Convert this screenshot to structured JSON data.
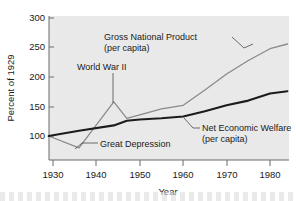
{
  "chart_data": {
    "type": "line",
    "title": "",
    "xlabel": "Year",
    "ylabel": "Percent of 1929",
    "xlim": [
      1929,
      1984
    ],
    "ylim": [
      60,
      300
    ],
    "xticks": [
      "1930",
      "1940",
      "1950",
      "1960",
      "1970",
      "1980"
    ],
    "xtick_values": [
      1930,
      1940,
      1950,
      1960,
      1970,
      1980
    ],
    "yticks": [
      "100",
      "150",
      "200",
      "250",
      "300"
    ],
    "ytick_values": [
      100,
      150,
      200,
      250,
      300
    ],
    "grid": false,
    "legend": "annotations-inline",
    "series": [
      {
        "name": "Gross National Product (per capita)",
        "color": "#8a8a8a",
        "x": [
          1929,
          1936,
          1944,
          1947,
          1950,
          1955,
          1960,
          1965,
          1970,
          1975,
          1980,
          1984
        ],
        "values": [
          100,
          80,
          158,
          130,
          136,
          146,
          152,
          178,
          205,
          228,
          248,
          256
        ]
      },
      {
        "name": "Net Economic Welfare (per capita)",
        "color": "#1c1c1c",
        "x": [
          1929,
          1936,
          1944,
          1947,
          1950,
          1955,
          1960,
          1965,
          1970,
          1975,
          1980,
          1984
        ],
        "values": [
          100,
          109,
          118,
          126,
          128,
          130,
          133,
          142,
          152,
          160,
          172,
          176
        ]
      }
    ],
    "annotations": [
      {
        "id": "gnp-label",
        "line1": "Gross National Product",
        "line2": "(per capita)",
        "target_x": 1973,
        "target_y": 228
      },
      {
        "id": "wwii-label",
        "line1": "World War II",
        "line2": "",
        "target_x": 1944,
        "target_y": 158
      },
      {
        "id": "great-depression-label",
        "line1": "Great Depression",
        "line2": "",
        "target_x": 1936,
        "target_y": 80
      },
      {
        "id": "new-label",
        "line1": "Net Economic Welfare",
        "line2": "(per capita)",
        "target_x": 1959,
        "target_y": 133
      }
    ]
  },
  "axes": {
    "y_title": "Percent of 1929",
    "x_title": "Year"
  },
  "ticks": {
    "y": [
      "300",
      "250",
      "200",
      "150",
      "100"
    ],
    "x": [
      "1930",
      "1940",
      "1950",
      "1960",
      "1970",
      "1980"
    ]
  },
  "labels": {
    "gnp_line1": "Gross National Product",
    "gnp_line2": "(per capita)",
    "wwii": "World War II",
    "depression": "Great Depression",
    "new_line1": "Net Economic Welfare",
    "new_line2": "(per capita)"
  },
  "colors": {
    "plot_background": "#e9e9e9",
    "page_background": "#ffffff",
    "gnp": "#8a8a8a",
    "new": "#1c1c1c",
    "axis": "#6b6b6b",
    "text": "#1a1a1a"
  }
}
